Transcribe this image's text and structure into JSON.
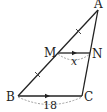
{
  "figure": {
    "type": "triangle-midsegment",
    "vertices": {
      "A": {
        "label": "A",
        "x": 98,
        "y": 10
      },
      "B": {
        "label": "B",
        "x": 18,
        "y": 96
      },
      "C": {
        "label": "C",
        "x": 82,
        "y": 96
      },
      "M": {
        "label": "M",
        "x": 58,
        "y": 53
      },
      "N": {
        "label": "N",
        "x": 90,
        "y": 53
      }
    },
    "segments": {
      "MN": {
        "label": "x",
        "parallel_marker": "arrow"
      },
      "BC": {
        "label": "18",
        "parallel_marker": "arrow"
      }
    },
    "congruence_ticks": [
      "AM",
      "MB"
    ],
    "colors": {
      "stroke": "#222222",
      "dashed": "#888888"
    }
  }
}
